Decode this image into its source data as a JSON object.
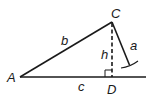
{
  "diagram": {
    "type": "triangle-altitude",
    "vertices": {
      "A": {
        "label": "A",
        "x": 20,
        "y": 77
      },
      "C": {
        "label": "C",
        "x": 112,
        "y": 22
      },
      "D": {
        "label": "D",
        "x": 112,
        "y": 77
      }
    },
    "sides": {
      "a": {
        "label": "a"
      },
      "b": {
        "label": "b"
      },
      "c": {
        "label": "c"
      }
    },
    "altitude": {
      "label": "h",
      "style": "dashed"
    },
    "right_angle_marker_at": "D",
    "colors": {
      "stroke": "#1a1a1a",
      "background": "#ffffff"
    }
  }
}
